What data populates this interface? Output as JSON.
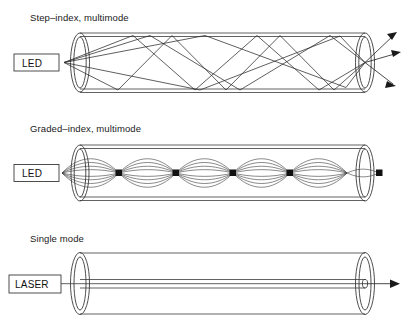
{
  "figure": {
    "type": "optical-fiber-propagation-diagram",
    "background_color": "#ffffff",
    "line_color": "#3a3a3a",
    "ray_color": "#2b2b2b",
    "text_color": "#1a1a1a"
  },
  "sections": [
    {
      "id": "step-index-multimode",
      "title": "Step–index, multimode",
      "source_label": "LED",
      "exit_arrow_count": 3,
      "ray_count": 5,
      "propagation": "zigzag-total-internal-reflection"
    },
    {
      "id": "graded-index-multimode",
      "title": "Graded–index, multimode",
      "source_label": "LED",
      "exit_arrow_count": 0,
      "ray_count": 6,
      "node_count": 5,
      "propagation": "sinusoidal-refocusing"
    },
    {
      "id": "single-mode",
      "title": "Single mode",
      "source_label": "LASER",
      "exit_arrow_count": 1,
      "ray_count": 1,
      "propagation": "axial-single-ray"
    }
  ]
}
